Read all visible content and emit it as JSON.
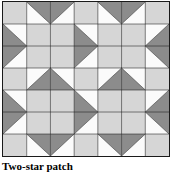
{
  "figure": {
    "caption": "Two-star patch",
    "title": "Two-star patch"
  },
  "colors": {
    "light": "#d6d6d6",
    "dark": "#8c8c8c",
    "white": "#fbfbfb",
    "line": "#1a1a1a",
    "background": "#ffffff",
    "caption_text": "#000000"
  },
  "quilt": {
    "rows": 7,
    "cols": 7,
    "description": "Seven by seven patchwork grid of square blocks; each block is either a solid light-gray square or a square split on a diagonal into a white triangle and a dark-gray triangle, arranged to form two eight-pointed star motifs.",
    "cell_codes_legend": {
      "L": "solid light gray square",
      "D": "solid dark gray square",
      "W": "solid white square",
      "tl": "diagonal split, white triangle in top-left corner, dark gray in bottom-right",
      "tr": "diagonal split, white triangle in top-right corner, dark gray in bottom-left",
      "bl": "diagonal split, white triangle in bottom-left corner, dark gray in top-right",
      "br": "diagonal split, white triangle in bottom-right corner, dark gray in top-left"
    },
    "cells": [
      [
        "L",
        "bl",
        "br",
        "L",
        "bl",
        "br",
        "L"
      ],
      [
        "tr",
        "L",
        "L",
        "tr",
        "L",
        "L",
        "tl"
      ],
      [
        "br",
        "L",
        "L",
        "br",
        "L",
        "L",
        "bl"
      ],
      [
        "L",
        "tl",
        "tr",
        "L",
        "tl",
        "tr",
        "L"
      ],
      [
        "tr",
        "L",
        "L",
        "tr",
        "L",
        "L",
        "tl"
      ],
      [
        "br",
        "L",
        "L",
        "br",
        "L",
        "L",
        "bl"
      ],
      [
        "L",
        "bl",
        "br",
        "L",
        "bl",
        "br",
        "L"
      ]
    ]
  }
}
